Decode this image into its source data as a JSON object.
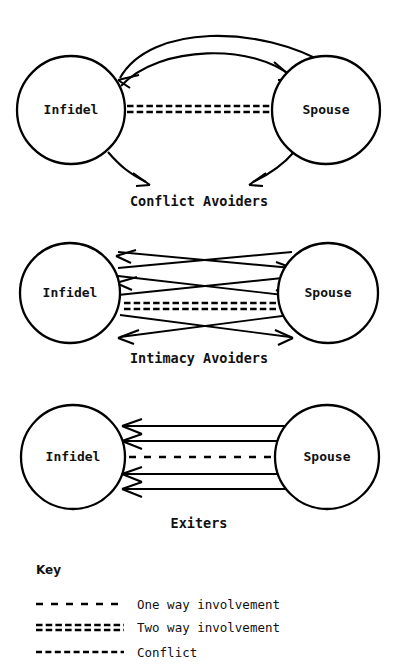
{
  "figure": {
    "background_color": "#ffffff",
    "ink_color": "#000000"
  },
  "diagrams": [
    {
      "id": "conflict-avoiders",
      "caption": "Conflict Avoiders",
      "left_node": "Infidel",
      "right_node": "Spouse",
      "relationship_line": "two-way",
      "connections": [
        "curved arc from Spouse to Infidel (arrowhead at Infidel)",
        "curved arc from Infidel to Spouse (arrowhead at Spouse)",
        "two-way involvement line between Infidel and Spouse",
        "outward conflict arrow from Infidel pointing down toward caption",
        "outward conflict arrow from Spouse pointing down toward caption"
      ]
    },
    {
      "id": "intimacy-avoiders",
      "caption": "Intimacy Avoiders",
      "left_node": "Infidel",
      "right_node": "Spouse",
      "relationship_line": "two-way",
      "connections": [
        "crossing diagonal arrow pair above the center line",
        "second crossing diagonal arrow pair above the center line",
        "two-way involvement line between Infidel and Spouse",
        "crossing diagonal arrow pair below the center line"
      ]
    },
    {
      "id": "exiters",
      "caption": "Exiters",
      "left_node": "Infidel",
      "right_node": "Spouse",
      "relationship_line": "one-way",
      "connections": [
        "straight arrow from Spouse to Infidel",
        "straight arrow from Spouse to Infidel",
        "one way involvement line between Spouse and Infidel",
        "straight arrow from Spouse to Infidel",
        "straight arrow from Spouse to Infidel"
      ]
    }
  ],
  "key": {
    "heading": "Key",
    "entries": [
      {
        "style": "one-way",
        "label": "One way involvement"
      },
      {
        "style": "two-way",
        "label": "Two way involvement"
      },
      {
        "style": "conflict",
        "label": "Conflict"
      }
    ]
  }
}
